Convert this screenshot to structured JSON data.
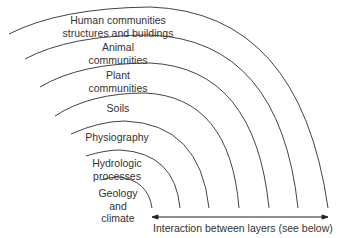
{
  "diagram": {
    "type": "nested concentric layers",
    "layers": [
      {
        "id": "human",
        "label_lines": [
          "Human communities",
          "structures and buildings"
        ]
      },
      {
        "id": "animal",
        "label_lines": [
          "Animal",
          "communities"
        ]
      },
      {
        "id": "plant",
        "label_lines": [
          "Plant",
          "communities"
        ]
      },
      {
        "id": "soils",
        "label_lines": [
          "Soils"
        ]
      },
      {
        "id": "physiography",
        "label_lines": [
          "Physiography"
        ]
      },
      {
        "id": "hydrologic",
        "label_lines": [
          "Hydrologic",
          "processes"
        ]
      },
      {
        "id": "geology",
        "label_lines": [
          "Geology",
          "and",
          "climate"
        ]
      }
    ],
    "arrow_label": "Interaction between layers (see below)",
    "line_color": "#444444"
  }
}
